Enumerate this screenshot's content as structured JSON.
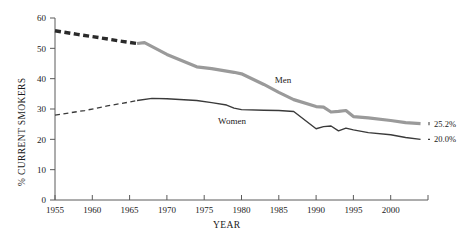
{
  "chart_data": {
    "type": "line",
    "title": "",
    "xlabel": "YEAR",
    "ylabel": "% CURRENT SMOKERS",
    "xlim": [
      1955,
      2005
    ],
    "ylim": [
      0,
      60
    ],
    "grid": false,
    "legend_position": "inline-annotation",
    "xticks": [
      "1955",
      "1960",
      "1965",
      "1970",
      "1975",
      "1980",
      "1985",
      "1990",
      "1995",
      "2000"
    ],
    "xtick_values": [
      1955,
      1960,
      1965,
      1970,
      1975,
      1980,
      1985,
      1990,
      1995,
      2000
    ],
    "yticks": [
      "0",
      "10",
      "20",
      "30",
      "40",
      "50",
      "60"
    ],
    "ytick_values": [
      0,
      10,
      20,
      30,
      40,
      50,
      60
    ],
    "series": [
      {
        "name": "Men",
        "color": "#9a9a9a",
        "dashed_color": "#2a2a2a",
        "label": "Men",
        "end_label": "25.2%",
        "dashed_segment": {
          "x": [
            1955,
            1958,
            1961,
            1964,
            1966
          ],
          "values": [
            55.8,
            54.6,
            53.5,
            52.3,
            51.6
          ]
        },
        "solid_segment": {
          "x": [
            1966,
            1967,
            1970,
            1974,
            1976,
            1979,
            1980,
            1983,
            1985,
            1987,
            1990,
            1991,
            1992,
            1993,
            1994,
            1995,
            1997,
            2000,
            2002,
            2004
          ],
          "values": [
            51.6,
            51.9,
            48.0,
            43.9,
            43.3,
            42.1,
            41.6,
            38.1,
            35.5,
            33.1,
            30.8,
            30.6,
            29.0,
            29.2,
            29.5,
            27.5,
            27.1,
            26.2,
            25.5,
            25.2
          ]
        }
      },
      {
        "name": "Women",
        "color": "#3a3a3a",
        "dashed_color": "#3a3a3a",
        "label": "Women",
        "end_label": "20.0%",
        "dashed_segment": {
          "x": [
            1955,
            1959,
            1962,
            1965,
            1966
          ],
          "values": [
            28.0,
            29.5,
            31.0,
            32.3,
            32.8
          ]
        },
        "solid_segment": {
          "x": [
            1966,
            1968,
            1970,
            1974,
            1976,
            1978,
            1979,
            1980,
            1983,
            1985,
            1987,
            1990,
            1991,
            1992,
            1993,
            1994,
            1995,
            1997,
            2000,
            2002,
            2004
          ],
          "values": [
            32.8,
            33.5,
            33.4,
            32.8,
            32.1,
            31.3,
            30.3,
            29.8,
            29.6,
            29.5,
            29.2,
            23.5,
            24.2,
            24.4,
            22.8,
            23.7,
            23.1,
            22.2,
            21.5,
            20.6,
            20.0
          ]
        }
      }
    ]
  },
  "annotations": {
    "men_label": "Men",
    "women_label": "Women",
    "men_end_value": "25.2%",
    "women_end_value": "20.0%"
  },
  "axes": {
    "x_title": "YEAR",
    "y_title": "% CURRENT SMOKERS"
  },
  "colors": {
    "men_line": "#9a9a9a",
    "women_line": "#3a3a3a",
    "dash_lead": "#2a2a2a",
    "axis": "#5a5a5a",
    "text": "#1a1a1a"
  }
}
